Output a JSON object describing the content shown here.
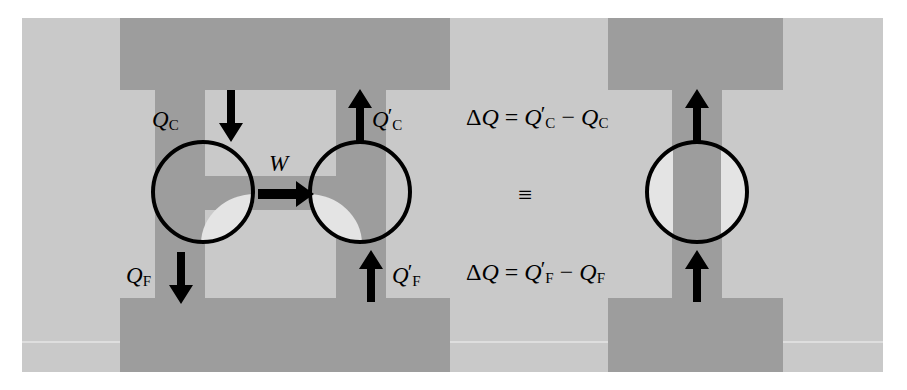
{
  "figure": {
    "colors": {
      "page_background": "#ffffff",
      "panel_light_gray": "#c9c9c9",
      "reservoir_dark_gray": "#9d9d9d",
      "notch_pale_gray": "#e4e4e4",
      "ink_black": "#000000",
      "seam_line": "#dedede"
    }
  },
  "labels": {
    "qc": {
      "symbol": "Q",
      "subscript": "C",
      "prime": "",
      "text": "Q_C"
    },
    "qc_prime": {
      "symbol": "Q",
      "subscript": "C",
      "prime": "′",
      "text": "Q'_C"
    },
    "qf": {
      "symbol": "Q",
      "subscript": "F",
      "prime": "",
      "text": "Q_F"
    },
    "qf_prime": {
      "symbol": "Q",
      "subscript": "F",
      "prime": "′",
      "text": "Q'_F"
    },
    "work": {
      "symbol": "W",
      "text": "W"
    }
  },
  "equations": {
    "top": {
      "delta": "Δ",
      "lhs_symbol": "Q",
      "equals": "=",
      "minus": "−",
      "first_symbol": "Q",
      "first_prime": "′",
      "first_subscript": "C",
      "second_symbol": "Q",
      "second_subscript": "C",
      "text": "ΔQ = Q′_C − Q_C"
    },
    "identity": {
      "glyph": "≡",
      "text": "≡"
    },
    "bottom": {
      "delta": "Δ",
      "lhs_symbol": "Q",
      "equals": "=",
      "minus": "−",
      "first_symbol": "Q",
      "first_prime": "′",
      "first_subscript": "F",
      "second_symbol": "Q",
      "second_subscript": "F",
      "text": "ΔQ = Q′_F − Q_F"
    }
  },
  "arrows": {
    "qc_down": {
      "direction": "down"
    },
    "qc_prime_up": {
      "direction": "up"
    },
    "qf_down": {
      "direction": "down"
    },
    "qf_prime_up": {
      "direction": "up"
    },
    "work_right": {
      "direction": "right"
    },
    "right_top_up": {
      "direction": "up"
    },
    "right_bottom_up": {
      "direction": "up"
    }
  }
}
